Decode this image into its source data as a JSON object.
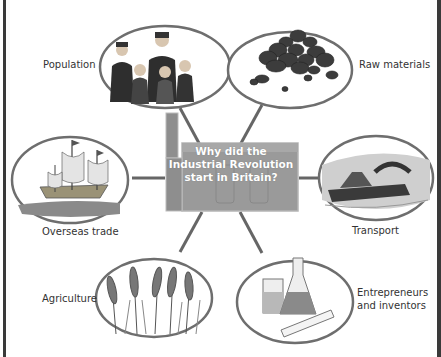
{
  "diagram": {
    "title": "Why did the Industrial Revolution start in Britain?",
    "center": {
      "lines": [
        "Why did the",
        "Industrial Revolution",
        "start in Britain?"
      ],
      "icon": "factory-icon"
    },
    "nodes": [
      {
        "id": "population",
        "label": "Population",
        "icon": "family-icon"
      },
      {
        "id": "raw-materials",
        "label": "Raw materials",
        "icon": "coal-pile-icon"
      },
      {
        "id": "overseas-trade",
        "label": "Overseas trade",
        "icon": "sailing-ship-icon"
      },
      {
        "id": "transport",
        "label": "Transport",
        "icon": "canal-boat-icon"
      },
      {
        "id": "agriculture",
        "label": "Agriculture",
        "icon": "wheat-icon"
      },
      {
        "id": "entrepreneurs",
        "label_lines": [
          "Entrepreneurs",
          "and inventors"
        ],
        "icon": "lab-flask-icon"
      }
    ],
    "colors": {
      "ring": "#6e6e6e",
      "connector": "#666666",
      "center_fill": "#9c9c9c",
      "frame": "#3a3a3a"
    }
  }
}
